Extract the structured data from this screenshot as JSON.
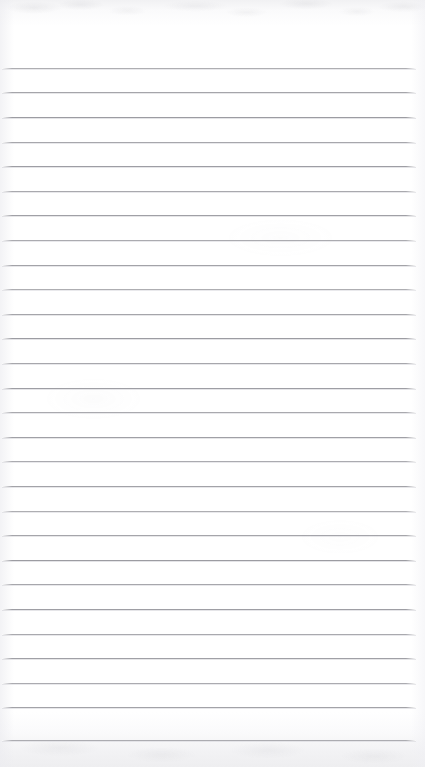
{
  "document": {
    "type": "scanned-ruled-paper",
    "title": "Blank ruled notepad page",
    "content_text": "",
    "page_width": 425,
    "page_height": 767,
    "background_color": "#ffffff",
    "rule_color": "#9a9aa0",
    "rule_thickness": 1,
    "top_edge_band_color": "#f1f1f3",
    "bottom_edge_band_color": "#eeeef0"
  },
  "ruling": {
    "line_count": 28,
    "first_line_y": 68,
    "line_spacing": 24.6,
    "line_left_x": 2,
    "line_right_x": 416,
    "top_margin_height": 68,
    "bottom_margin_height": 27,
    "left_margin_width": 2,
    "right_margin_width": 9,
    "line_ys": [
      68,
      92,
      117,
      142,
      166,
      191,
      215,
      240,
      265,
      289,
      314,
      338,
      363,
      388,
      412,
      437,
      461,
      486,
      511,
      535,
      560,
      584,
      609,
      634,
      658,
      683,
      707,
      740
    ]
  },
  "regions": {
    "top_margin_label": "top blank margin",
    "body_label": "ruled writing area",
    "bottom_margin_label": "bottom blank margin"
  }
}
